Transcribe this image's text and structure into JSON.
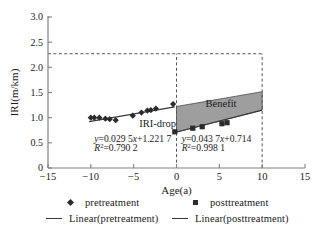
{
  "chart_data": {
    "type": "scatter",
    "title": "",
    "xlabel": "Age(a)",
    "ylabel": "IRI(m/km)",
    "xlim": [
      -15,
      15
    ],
    "ylim": [
      0,
      3.0
    ],
    "xticks": [
      "-15",
      "-10",
      "-5",
      "0",
      "5",
      "10",
      "15"
    ],
    "xtick_values": [
      -15,
      -10,
      -5,
      0,
      5,
      10,
      15
    ],
    "yticks": [
      "0",
      "0.5",
      "1.0",
      "1.5",
      "2.0",
      "2.5",
      "3.0"
    ],
    "ytick_values": [
      0,
      0.5,
      1.0,
      1.5,
      2.0,
      2.5,
      3.0
    ],
    "grid": false,
    "legend_position": "bottom",
    "series": [
      {
        "name": "pretreatment",
        "type": "scatter",
        "marker": "diamond",
        "color": "#2b2b2b",
        "points": [
          [
            -10.0,
            1.0
          ],
          [
            -9.6,
            1.0
          ],
          [
            -9.0,
            1.0
          ],
          [
            -8.3,
            0.98
          ],
          [
            -7.8,
            0.97
          ],
          [
            -7.1,
            0.95
          ],
          [
            -5.1,
            1.04
          ],
          [
            -4.1,
            1.1
          ],
          [
            -3.4,
            1.14
          ],
          [
            -3.0,
            1.15
          ],
          [
            -2.4,
            1.18
          ],
          [
            -0.4,
            1.27
          ]
        ]
      },
      {
        "name": "posttreatment",
        "type": "scatter",
        "marker": "square",
        "color": "#2b2b2b",
        "points": [
          [
            -0.2,
            0.72
          ],
          [
            1.9,
            0.79
          ],
          [
            3.0,
            0.82
          ],
          [
            5.3,
            0.88
          ],
          [
            5.9,
            0.9
          ]
        ]
      },
      {
        "name": "Linear(pretreatment)",
        "type": "line",
        "color": "#3a3a3a",
        "slope": 0.0295,
        "intercept": 1.2217,
        "x_range": [
          -10.2,
          -0.2
        ]
      },
      {
        "name": "Linear(posttreatment)",
        "type": "line",
        "color": "#3a3a3a",
        "slope": 0.0437,
        "intercept": 0.714,
        "x_range": [
          -0.2,
          10.0
        ]
      }
    ],
    "shaded_region": {
      "label": "Benefit",
      "fill": "#9e9e9e",
      "x_range": [
        0,
        10
      ],
      "upper_at_x0": 1.2217,
      "upper_at_x10": 1.5167,
      "lower_at_x0": 0.714,
      "lower_at_x10": 1.151
    },
    "reference_lines": [
      {
        "name": "threshold",
        "orientation": "horizontal",
        "value": 2.27,
        "style": "dashed"
      },
      {
        "name": "treatment-age",
        "orientation": "vertical",
        "value": 0,
        "style": "dashed"
      },
      {
        "name": "analysis-end-age",
        "orientation": "vertical",
        "value": 10,
        "style": "dashed"
      }
    ],
    "annotations": [
      {
        "name": "iri-drop-label",
        "text": "IRI-drop",
        "x": -2.2,
        "y": 0.82
      },
      {
        "name": "benefit-label",
        "text": "Benefit",
        "x": 5.2,
        "y": 1.22
      },
      {
        "name": "pre-equation",
        "text": "y=0.029 5x+1.221 7",
        "x": -9.6,
        "y": 0.52
      },
      {
        "name": "pre-r2",
        "text": "R²=0.790 2",
        "x": -9.6,
        "y": 0.33
      },
      {
        "name": "post-equation",
        "text": "y=0.043 7x+0.714",
        "x": 0.6,
        "y": 0.52
      },
      {
        "name": "post-r2",
        "text": "R²=0.998 1",
        "x": 0.6,
        "y": 0.33
      }
    ]
  },
  "axes": {
    "x_title": "Age(a)",
    "y_title": "IRI(m/km)",
    "x_tick_labels": [
      "-15",
      "-10",
      "-5",
      "0",
      "5",
      "10",
      "15"
    ],
    "y_tick_labels": [
      "3.0",
      "2.5",
      "2.0",
      "1.5",
      "1.0",
      "0.5",
      "0"
    ]
  },
  "labels": {
    "iri_drop": "IRI-drop",
    "benefit": "Benefit",
    "pre_equation": "y=0.029 5x+1.221 7",
    "pre_r2_prefix": "R",
    "pre_r2_sup": "2",
    "pre_r2_value": "=0.790 2",
    "post_equation": "y=0.043 7x+0.714",
    "post_r2_prefix": "R",
    "post_r2_sup": "2",
    "post_r2_value": "=0.998 1"
  },
  "legend": {
    "items": [
      {
        "label": "pretreatment",
        "marker": "diamond"
      },
      {
        "label": "posttreatment",
        "marker": "square"
      },
      {
        "label": "Linear(pretreatment)",
        "marker": "line"
      },
      {
        "label": "Linear(posttreatment)",
        "marker": "line"
      }
    ]
  },
  "colors": {
    "marker": "#2b2b2b",
    "line": "#3a3a3a",
    "axis": "#808080",
    "shade": "#9e9e9e",
    "dash": "#555555"
  }
}
